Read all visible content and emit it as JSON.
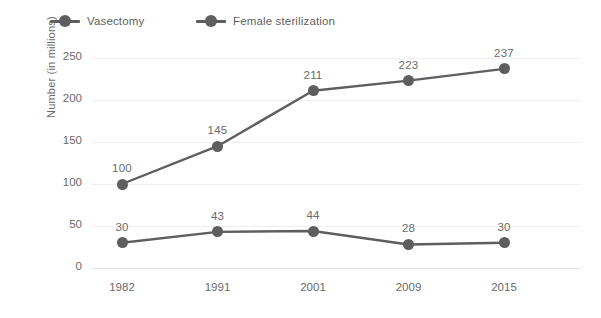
{
  "legend": {
    "position": "top-left",
    "items": [
      {
        "label": "Vasectomy",
        "marker": "circle-line-marker",
        "color": "#5e5e5e"
      },
      {
        "label": "Female sterilization",
        "marker": "circle-line-marker",
        "color": "#5e5e5e"
      }
    ]
  },
  "axes": {
    "y_title": "Number (in millions)",
    "y_ticks": [
      "0",
      "50",
      "100",
      "150",
      "200",
      "250"
    ],
    "x_ticks": [
      "1982",
      "1991",
      "2001",
      "2009",
      "2015"
    ]
  },
  "chart_data": {
    "type": "line",
    "title": "",
    "subtitle": "",
    "xlabel": "",
    "ylabel": "Number (in millions)",
    "categories": [
      "1982",
      "1991",
      "2001",
      "2009",
      "2015"
    ],
    "series": [
      {
        "name": "Vasectomy",
        "color": "#5e5e5e",
        "values": [
          30,
          43,
          44,
          28,
          30
        ],
        "labels": [
          "30",
          "43",
          "44",
          "28",
          "30"
        ]
      },
      {
        "name": "Female sterilization",
        "color": "#5e5e5e",
        "values": [
          100,
          145,
          211,
          223,
          237
        ],
        "labels": [
          "100",
          "145",
          "211",
          "223",
          "237"
        ]
      }
    ],
    "ylim": [
      0,
      250
    ],
    "ytick_values": [
      0,
      50,
      100,
      150,
      200,
      250
    ],
    "grid": "horizontal",
    "legend_position": "top-left",
    "data_labels": true
  },
  "colors": {
    "background": "#ffffff",
    "series": "#5e5e5e",
    "gridline": "#f0eef0",
    "baseline": "#e2e0e2",
    "text": "#6a6a6a"
  }
}
